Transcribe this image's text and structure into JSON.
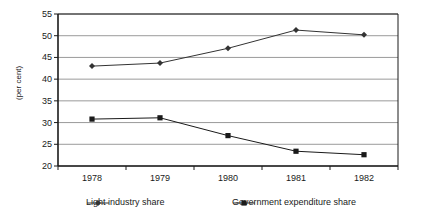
{
  "chart_data": {
    "type": "line",
    "title": "",
    "subtitle": "",
    "xlabel": "",
    "ylabel": "(per cent)",
    "categories": [
      "1978",
      "1979",
      "1980",
      "1981",
      "1982"
    ],
    "x": [
      1978,
      1979,
      1980,
      1981,
      1982
    ],
    "ylim": [
      20,
      55
    ],
    "yticks": [
      20,
      25,
      30,
      35,
      40,
      45,
      50,
      55
    ],
    "ytick_labels": [
      "20",
      "25",
      "30",
      "35",
      "40",
      "45",
      "50",
      "55"
    ],
    "grid": true,
    "grid_axis": "y",
    "legend_position": "bottom",
    "series": [
      {
        "name": "Light industry share",
        "marker": "diamond",
        "color": "#333333",
        "values": [
          43.0,
          43.7,
          47.1,
          51.3,
          50.2
        ]
      },
      {
        "name": "Government expenditure share",
        "marker": "square",
        "color": "#1a1a1a",
        "values": [
          30.8,
          31.1,
          27.0,
          23.4,
          22.6
        ]
      }
    ]
  },
  "legend": {
    "items": [
      {
        "label": "Light industry share",
        "marker": "diamond"
      },
      {
        "label": "Government expenditure share",
        "marker": "square"
      }
    ]
  },
  "colors": {
    "line": "#333333",
    "grid": "#808080",
    "axis": "#1a1a1a",
    "background": "#ffffff"
  }
}
